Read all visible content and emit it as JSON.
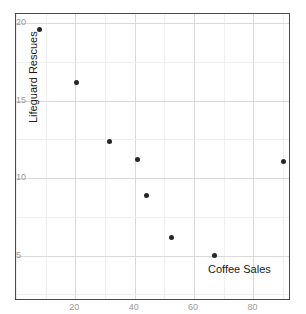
{
  "chart_data": {
    "type": "scatter",
    "title": "",
    "xlabel": "Coffee Sales",
    "ylabel": "Lifeguard Rescues",
    "xlim": [
      0,
      92
    ],
    "ylim": [
      2.2,
      20.6
    ],
    "xticks": [
      20,
      40,
      60,
      80
    ],
    "yticks": [
      5,
      10,
      15,
      20
    ],
    "xtick_labels": [
      "20",
      "40",
      "60",
      "80"
    ],
    "ytick_labels": [
      "5",
      "10",
      "15",
      "20"
    ],
    "grid": true,
    "legend": "none",
    "point_color": "#262626",
    "grid_color": "#d9d9d9",
    "frame_color": "#4a4a4a",
    "tick_color": "#9a9a9a",
    "points": [
      {
        "x": 8,
        "y": 19.6
      },
      {
        "x": 20.5,
        "y": 16.2
      },
      {
        "x": 31.5,
        "y": 12.4
      },
      {
        "x": 41,
        "y": 11.2
      },
      {
        "x": 44,
        "y": 8.9
      },
      {
        "x": 52.5,
        "y": 6.2
      },
      {
        "x": 67,
        "y": 5.0
      },
      {
        "x": 90,
        "y": 11.1
      }
    ]
  },
  "axis": {
    "x_title": "Coffee Sales",
    "y_title": "Lifeguard Rescues"
  }
}
